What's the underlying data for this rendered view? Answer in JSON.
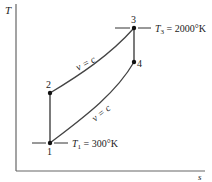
{
  "diagram": {
    "type": "T-s diagram (Otto cycle)",
    "axes": {
      "y_label": "T",
      "x_label": "s"
    },
    "points": [
      {
        "id": "1",
        "label": "1",
        "x": 50,
        "y": 143
      },
      {
        "id": "2",
        "label": "2",
        "x": 50,
        "y": 93
      },
      {
        "id": "3",
        "label": "3",
        "x": 134,
        "y": 28
      },
      {
        "id": "4",
        "label": "4",
        "x": 134,
        "y": 62
      }
    ],
    "curves": {
      "upper_label": "v = c",
      "lower_label": "v = c"
    },
    "annotations": {
      "t1_symbol": "T",
      "t1_sub": "1",
      "t1_value": " = 300°K",
      "t3_symbol": "T",
      "t3_sub": "3",
      "t3_value": " = 2000°K"
    },
    "colors": {
      "line": "#333333",
      "axis": "#555555",
      "point": "#111111"
    }
  }
}
